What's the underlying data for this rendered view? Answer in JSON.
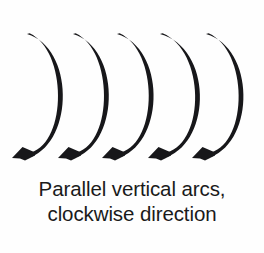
{
  "figure": {
    "name": "parallel-vertical-arcs-clockwise",
    "background_color": "#fefefe",
    "ink_color": "#17171a",
    "caption": {
      "line1": "Parallel vertical arcs,",
      "line2": "clockwise direction"
    },
    "diagram": {
      "type": "arrow-stroke-diagram",
      "arrow_count": 5,
      "arrow_direction": "clockwise",
      "orientation": "vertical",
      "arrowhead_style": "barbed-swallowtail",
      "arrowhead_position": "bottom-left",
      "stroke_start": "top-left-taper",
      "arrows": [
        {
          "label": "arc-1",
          "start_x": 27,
          "start_y": 34,
          "bulge_x": 72,
          "bulge_y": 95,
          "tip_x": 12,
          "tip_y": 158
        },
        {
          "label": "arc-2",
          "start_x": 73,
          "start_y": 34,
          "bulge_x": 118,
          "bulge_y": 95,
          "tip_x": 58,
          "tip_y": 158
        },
        {
          "label": "arc-3",
          "start_x": 117,
          "start_y": 34,
          "bulge_x": 163,
          "bulge_y": 95,
          "tip_x": 102,
          "tip_y": 158
        },
        {
          "label": "arc-4",
          "start_x": 160,
          "start_y": 34,
          "bulge_x": 210,
          "bulge_y": 95,
          "tip_x": 148,
          "tip_y": 158
        },
        {
          "label": "arc-5",
          "start_x": 206,
          "start_y": 34,
          "bulge_x": 253,
          "bulge_y": 95,
          "tip_x": 192,
          "tip_y": 158
        }
      ]
    }
  }
}
